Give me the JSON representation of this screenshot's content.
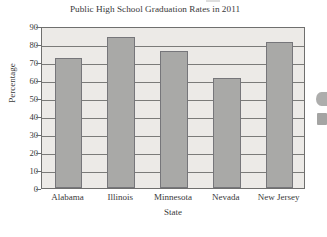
{
  "chart_data": {
    "type": "bar",
    "title": "Public High School Graduation Rates in 2011",
    "xlabel": "State",
    "ylabel": "Percentage",
    "categories": [
      "Alabama",
      "Illinois",
      "Minnesota",
      "Nevada",
      "New Jersey"
    ],
    "values": [
      72,
      84,
      76,
      61,
      81
    ],
    "ylim": [
      0,
      90
    ],
    "yticks": [
      0,
      10,
      20,
      30,
      40,
      50,
      60,
      70,
      80,
      90
    ],
    "ytick_labels": [
      "0",
      "10",
      "20",
      "30",
      "40",
      "50",
      "60",
      "70",
      "80",
      "90"
    ],
    "grid": true,
    "grid_axis": "y",
    "legend": null,
    "bar_color": "#a9a9a7",
    "bar_edge_color": "#76767a",
    "plot_background": "#eceae7",
    "figure_background": "#ffffff",
    "axis_color": "#6f6f6e",
    "text_color": "#39393a"
  },
  "artifacts": {
    "right_edge_mark_1": "partial-dark-blob",
    "right_edge_mark_2": "partial-dark-blob",
    "top_edge_mark": "faint-scan-streak"
  }
}
